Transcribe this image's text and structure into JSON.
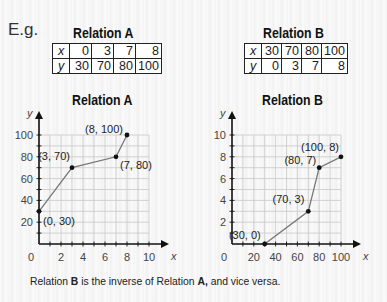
{
  "header": {
    "eg_label": "E.g."
  },
  "tables": {
    "a": {
      "title": "Relation A",
      "x_label": "x",
      "y_label": "y",
      "x": [
        "0",
        "3",
        "7",
        "8"
      ],
      "y": [
        "30",
        "70",
        "80",
        "100"
      ]
    },
    "b": {
      "title": "Relation B",
      "x_label": "x",
      "y_label": "y",
      "x": [
        "30",
        "70",
        "80",
        "100"
      ],
      "y": [
        "0",
        "3",
        "7",
        "8"
      ]
    }
  },
  "graphs": {
    "a": {
      "title": "Relation A"
    },
    "b": {
      "title": "Relation B"
    }
  },
  "footer": {
    "part1": "Relation ",
    "b_bold": "B",
    "part2": " is the inverse of Relation ",
    "a_bold": "A,",
    "part3": " and vice versa."
  },
  "chart_data": [
    {
      "type": "line",
      "title": "Relation A",
      "xlabel": "x",
      "ylabel": "y",
      "xlim": [
        0,
        10
      ],
      "ylim": [
        0,
        100
      ],
      "x_ticks": [
        "0",
        "2",
        "4",
        "6",
        "8",
        "10"
      ],
      "y_ticks": [
        "20",
        "40",
        "60",
        "80",
        "100"
      ],
      "grid": true,
      "x": [
        0,
        3,
        7,
        8
      ],
      "y": [
        30,
        70,
        80,
        100
      ],
      "point_labels": [
        "(0, 30)",
        "(3, 70)",
        "(7, 80)",
        "(8, 100)"
      ]
    },
    {
      "type": "line",
      "title": "Relation B",
      "xlabel": "x",
      "ylabel": "y",
      "xlim": [
        0,
        100
      ],
      "ylim": [
        0,
        10
      ],
      "x_ticks": [
        "0",
        "20",
        "40",
        "60",
        "80",
        "100"
      ],
      "y_ticks": [
        "2",
        "4",
        "6",
        "8",
        "10"
      ],
      "grid": true,
      "x": [
        30,
        70,
        80,
        100
      ],
      "y": [
        0,
        3,
        7,
        8
      ],
      "point_labels": [
        "(30, 0)",
        "(70, 3)",
        "(80, 7)",
        "(100, 8)"
      ]
    }
  ]
}
